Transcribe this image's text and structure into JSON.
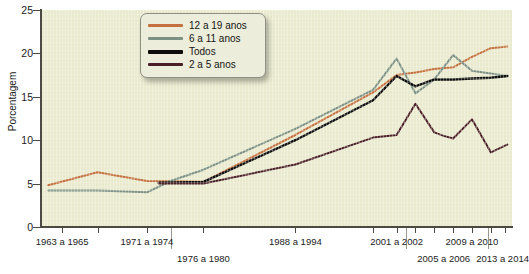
{
  "chart_data": {
    "type": "line",
    "title": "",
    "subtitle": "",
    "xlabel": "",
    "ylabel": "Porcentagem",
    "ylim": [
      0,
      25
    ],
    "yticks": [
      0,
      5,
      10,
      15,
      20,
      25
    ],
    "grid": false,
    "legend_position": "top-center",
    "background_color": "#e9eacd",
    "categories": [
      "1963 a 1965",
      "1971 a 1974",
      "1976 a 1980",
      "1988 a 1994",
      "1999 a 2000",
      "2001 a 2002",
      "2003 a 2004",
      "2005 a 2006",
      "2007 a 2008",
      "2009 a 2010",
      "2011 a 2012",
      "2013 a 2014"
    ],
    "x_axis_labels": [
      {
        "text": "1963 a 1965",
        "row": 0,
        "x_pct": 4.5
      },
      {
        "text": "1971 a 1974",
        "row": 0,
        "x_pct": 22.5
      },
      {
        "text": "1976 a 1980",
        "row": 1,
        "x_pct": 34.5
      },
      {
        "text": "1988 a 1994",
        "row": 0,
        "x_pct": 54.0
      },
      {
        "text": "2001 a 2002",
        "row": 0,
        "x_pct": 75.5
      },
      {
        "text": "2005 a 2006",
        "row": 1,
        "x_pct": 85.5
      },
      {
        "text": "2009 a 2010",
        "row": 0,
        "x_pct": 91.5
      },
      {
        "text": "2013 a 2014",
        "row": 1,
        "x_pct": 98.0
      }
    ],
    "x_tick_positions_pct": [
      4.5,
      12.0,
      22.5,
      34.5,
      54.0,
      70.5,
      75.5,
      79.5,
      83.5,
      87.5,
      91.5,
      95.5,
      98.5
    ],
    "x_separator_positions_pct": [
      27.5,
      77.5,
      95.0
    ],
    "series": [
      {
        "name": "12 a 19 anos",
        "color": "#c4713f",
        "points": [
          {
            "x_pct": 1.5,
            "y": 4.8
          },
          {
            "x_pct": 12.0,
            "y": 6.3
          },
          {
            "x_pct": 22.5,
            "y": 5.3
          },
          {
            "x_pct": 34.5,
            "y": 5.2
          },
          {
            "x_pct": 54.0,
            "y": 10.6
          },
          {
            "x_pct": 70.5,
            "y": 15.5
          },
          {
            "x_pct": 75.5,
            "y": 17.5
          },
          {
            "x_pct": 79.5,
            "y": 17.8
          },
          {
            "x_pct": 83.5,
            "y": 18.2
          },
          {
            "x_pct": 87.5,
            "y": 18.4
          },
          {
            "x_pct": 91.5,
            "y": 19.6
          },
          {
            "x_pct": 95.5,
            "y": 20.6
          },
          {
            "x_pct": 99.0,
            "y": 20.8
          }
        ]
      },
      {
        "name": "6 a 11 anos",
        "color": "#7c9084",
        "points": [
          {
            "x_pct": 1.5,
            "y": 4.2
          },
          {
            "x_pct": 12.0,
            "y": 4.2
          },
          {
            "x_pct": 22.5,
            "y": 4.0
          },
          {
            "x_pct": 27.5,
            "y": 5.3
          },
          {
            "x_pct": 34.5,
            "y": 6.6
          },
          {
            "x_pct": 54.0,
            "y": 11.3
          },
          {
            "x_pct": 70.5,
            "y": 15.8
          },
          {
            "x_pct": 75.5,
            "y": 19.4
          },
          {
            "x_pct": 79.5,
            "y": 15.4
          },
          {
            "x_pct": 83.5,
            "y": 17.0
          },
          {
            "x_pct": 87.5,
            "y": 19.8
          },
          {
            "x_pct": 91.5,
            "y": 18.0
          },
          {
            "x_pct": 99.0,
            "y": 17.4
          }
        ]
      },
      {
        "name": "Todos",
        "color": "#0d0d0d",
        "points": [
          {
            "x_pct": 25.0,
            "y": 5.1
          },
          {
            "x_pct": 34.5,
            "y": 5.2
          },
          {
            "x_pct": 54.0,
            "y": 10.0
          },
          {
            "x_pct": 70.5,
            "y": 14.6
          },
          {
            "x_pct": 75.5,
            "y": 17.4
          },
          {
            "x_pct": 79.5,
            "y": 16.2
          },
          {
            "x_pct": 83.5,
            "y": 17.0
          },
          {
            "x_pct": 87.5,
            "y": 17.0
          },
          {
            "x_pct": 91.5,
            "y": 17.1
          },
          {
            "x_pct": 95.5,
            "y": 17.2
          },
          {
            "x_pct": 99.0,
            "y": 17.4
          }
        ]
      },
      {
        "name": "2 a 5 anos",
        "color": "#4b1f27",
        "points": [
          {
            "x_pct": 25.0,
            "y": 5.0
          },
          {
            "x_pct": 34.5,
            "y": 5.0
          },
          {
            "x_pct": 54.0,
            "y": 7.2
          },
          {
            "x_pct": 70.5,
            "y": 10.3
          },
          {
            "x_pct": 75.5,
            "y": 10.6
          },
          {
            "x_pct": 79.5,
            "y": 14.2
          },
          {
            "x_pct": 83.5,
            "y": 10.9
          },
          {
            "x_pct": 85.5,
            "y": 10.5
          },
          {
            "x_pct": 87.5,
            "y": 10.2
          },
          {
            "x_pct": 91.5,
            "y": 12.4
          },
          {
            "x_pct": 95.5,
            "y": 8.6
          },
          {
            "x_pct": 99.0,
            "y": 9.5
          }
        ]
      }
    ]
  },
  "legend": {
    "items": [
      {
        "label": "12 a 19 anos",
        "color": "#c4713f"
      },
      {
        "label": "6 a 11 anos",
        "color": "#7c9084"
      },
      {
        "label": "Todos",
        "color": "#0d0d0d"
      },
      {
        "label": "2 a 5 anos",
        "color": "#4b1f27"
      }
    ]
  }
}
